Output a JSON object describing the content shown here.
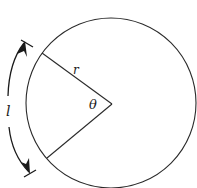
{
  "diagram": {
    "type": "circle-sector-arc-length",
    "colors": {
      "stroke": "#2a2a2a",
      "background": "#ffffff"
    },
    "circle": {
      "center": [
        112,
        104
      ],
      "radius": 85
    },
    "radius_endpoints": {
      "upper": [
        42,
        53
      ],
      "lower": [
        47,
        158
      ]
    },
    "labels": {
      "radius": "r",
      "angle": "θ",
      "arc_length": "l"
    }
  }
}
